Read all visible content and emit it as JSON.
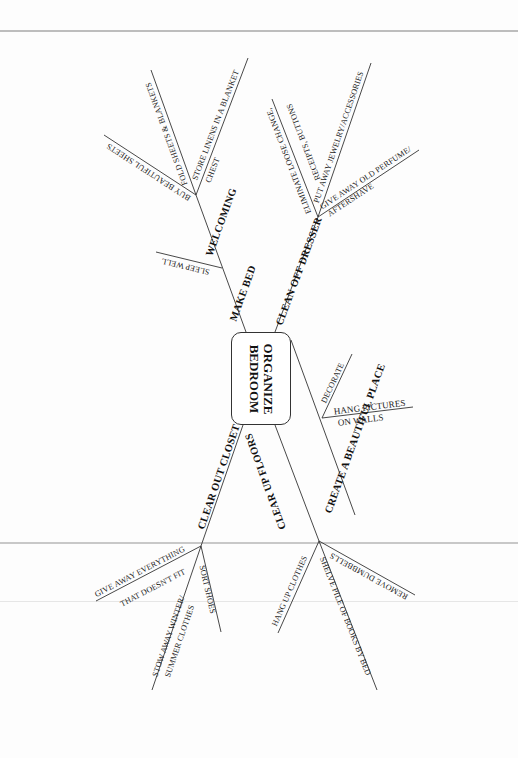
{
  "diagram": {
    "type": "mind-map",
    "center": {
      "line1": "ORGANIZE",
      "line2": "BEDROOM"
    },
    "branches": [
      {
        "label": "MAKE BED",
        "children": [
          {
            "label": "SLEEP WELL"
          },
          {
            "label": "WELCOMING",
            "children": [
              {
                "label": "BUY BEAUTIFUL SHEETS"
              },
              {
                "label": "FOLD SHEETS & BLANKETS"
              },
              {
                "label_line1": "STORE LINENS IN A BLANKET",
                "label_line2": "CHEST"
              }
            ]
          }
        ]
      },
      {
        "label": "CLEAN OFF DRESSER",
        "children": [
          {
            "label_line1": "ELIMINATE LOOSE CHANGE,",
            "label_line2": "RECEIPTS, BUTTONS"
          },
          {
            "label": "PUT AWAY JEWELRY/ACCESSORIES"
          },
          {
            "label_line1": "GIVE AWAY OLD PERFUME/",
            "label_line2": "AFTERSHAVE"
          }
        ]
      },
      {
        "label": "CREATE A BEAUTIFUL PLACE",
        "children": [
          {
            "label": "DECORATE"
          },
          {
            "label_line1": "HANG PICTURES",
            "label_line2": "ON WALLS"
          }
        ]
      },
      {
        "label": "CLEAR OUT CLOSET",
        "children": [
          {
            "label_line1": "GIVE AWAY EVERYTHING",
            "label_line2": "THAT DOESN'T FIT"
          },
          {
            "label_line1": "STOW AWAY WINTER/",
            "label_line2": "SUMMER CLOTHES"
          },
          {
            "label": "SORT SHOES"
          }
        ]
      },
      {
        "label": "CLEAR UP FLOORS",
        "children": [
          {
            "label": "HANG UP CLOTHES"
          },
          {
            "label": "SHELVE PILE OF BOOKS BY BED"
          },
          {
            "label": "REMOVE DUMBBELLS"
          }
        ]
      }
    ]
  }
}
